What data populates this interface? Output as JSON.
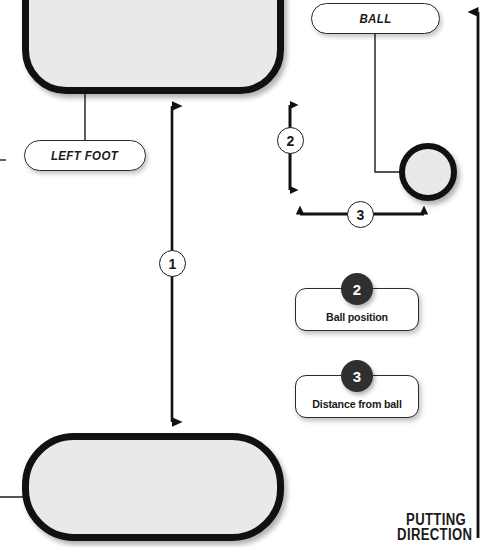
{
  "diagram": {
    "colors": {
      "shape_fill": "#e9e9e9",
      "shape_stroke": "#111111",
      "badge_fill": "#2f2f2f",
      "line": "#1a1a1a",
      "background": "#ffffff"
    }
  },
  "shapes": {
    "foot_top": {
      "name": "left foot outline"
    },
    "foot_bottom": {
      "name": "right foot outline"
    },
    "ball": {
      "name": "golf ball"
    }
  },
  "callout_pills": [
    {
      "id": "left-foot",
      "label": "LEFT FOOT"
    },
    {
      "id": "ball",
      "label": "BALL"
    }
  ],
  "measurements": [
    {
      "number": "1",
      "name": "stance width",
      "orientation": "vertical"
    },
    {
      "number": "2",
      "name": "ball position",
      "orientation": "vertical"
    },
    {
      "number": "3",
      "name": "distance from ball",
      "orientation": "horizontal"
    }
  ],
  "legend": [
    {
      "number": "2",
      "label": "Ball position"
    },
    {
      "number": "3",
      "label": "Distance from ball"
    }
  ],
  "putting_direction": {
    "line1": "PUTTING",
    "line2": "DIRECTION"
  }
}
